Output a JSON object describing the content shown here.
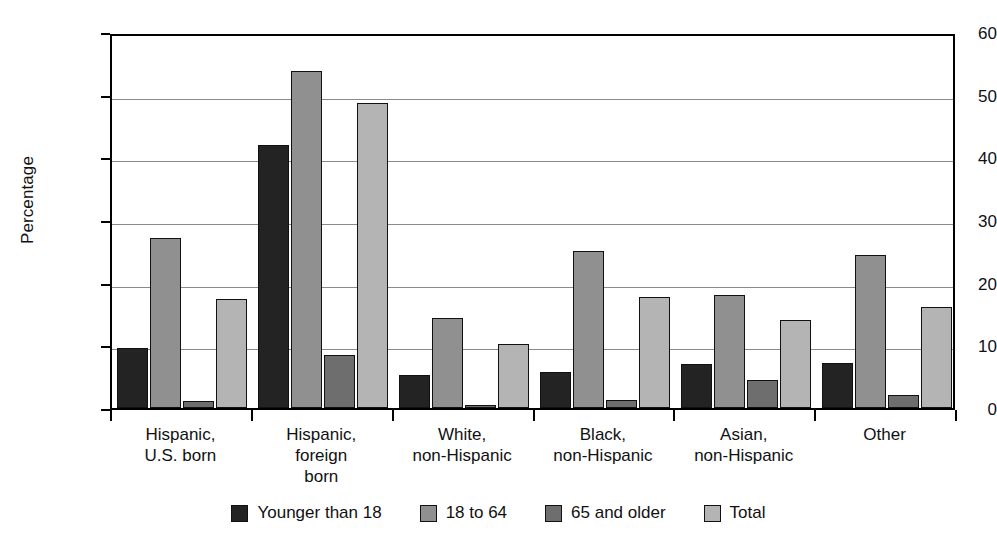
{
  "chart_data": {
    "type": "bar",
    "title": "",
    "xlabel": "",
    "ylabel": "Percentage",
    "ylim": [
      0,
      60
    ],
    "yticks": [
      0,
      10,
      20,
      30,
      40,
      50,
      60
    ],
    "ytick_labels": [
      "0",
      "10",
      "20",
      "30",
      "40",
      "50",
      "60"
    ],
    "grid": "horizontal",
    "legend_position": "bottom",
    "categories": [
      "Hispanic,\nU.S. born",
      "Hispanic,\nforeign\nborn",
      "White,\nnon-Hispanic",
      "Black,\nnon-Hispanic",
      "Asian,\nnon-Hispanic",
      "Other"
    ],
    "series": [
      {
        "name": "Younger than 18",
        "color": "#232323",
        "values": [
          9.5,
          41.9,
          5.2,
          5.8,
          7.0,
          7.2
        ]
      },
      {
        "name": "18 to 64",
        "color": "#909090",
        "values": [
          27.1,
          53.7,
          14.3,
          25.1,
          18.0,
          24.4
        ]
      },
      {
        "name": "65 and older",
        "color": "#6e6e6e",
        "values": [
          1.1,
          8.4,
          0.3,
          1.3,
          4.5,
          2.0
        ]
      },
      {
        "name": "Total",
        "color": "#b4b4b4",
        "values": [
          17.4,
          48.7,
          10.2,
          17.7,
          14.1,
          16.1
        ]
      }
    ]
  },
  "axis": {
    "y_title": "Percentage"
  }
}
